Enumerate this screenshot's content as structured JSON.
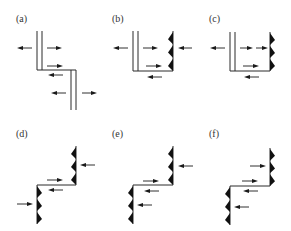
{
  "figure": {
    "panels": [
      {
        "id": "a",
        "label": "(a)",
        "label_pos": [
          16,
          22
        ],
        "upper": {
          "type": "double",
          "x": 37,
          "y1": 31,
          "y2": 70
        },
        "lower": {
          "type": "double",
          "x": 71,
          "y1": 70,
          "y2": 110
        },
        "step_y": 70,
        "arrows": [
          {
            "x1": 32,
            "x2": 17,
            "y": 48
          },
          {
            "x1": 47,
            "x2": 62,
            "y": 48
          },
          {
            "x1": 47,
            "x2": 63,
            "y": 66
          },
          {
            "x1": 63,
            "x2": 48,
            "y": 75
          },
          {
            "x1": 66,
            "x2": 51,
            "y": 93
          },
          {
            "x1": 82,
            "x2": 97,
            "y": 93
          }
        ]
      },
      {
        "id": "b",
        "label": "(b)",
        "label_pos": [
          112,
          22
        ],
        "upper": {
          "type": "double",
          "x": 133,
          "y1": 31,
          "y2": 71
        },
        "right_saw": {
          "x": 173,
          "y1": 31,
          "y2": 71,
          "dir": "left"
        },
        "step_y": 71,
        "step_x1": 133,
        "step_x2": 173,
        "arrows": [
          {
            "x1": 128,
            "x2": 113,
            "y": 48
          },
          {
            "x1": 143,
            "x2": 158,
            "y": 48
          },
          {
            "x1": 192,
            "x2": 178,
            "y": 48
          },
          {
            "x1": 146,
            "x2": 162,
            "y": 66
          },
          {
            "x1": 162,
            "x2": 147,
            "y": 77
          }
        ]
      },
      {
        "id": "c",
        "label": "(c)",
        "label_pos": [
          209,
          22
        ],
        "upper": {
          "type": "double",
          "x": 230,
          "y1": 32,
          "y2": 71
        },
        "right_saw": {
          "x": 270,
          "y1": 32,
          "y2": 71,
          "dir": "right"
        },
        "step_y": 71,
        "step_x1": 230,
        "step_x2": 270,
        "arrows": [
          {
            "x1": 225,
            "x2": 210,
            "y": 48
          },
          {
            "x1": 240,
            "x2": 253,
            "y": 48
          },
          {
            "x1": 256,
            "x2": 268,
            "y": 48
          },
          {
            "x1": 243,
            "x2": 259,
            "y": 66
          },
          {
            "x1": 259,
            "x2": 244,
            "y": 77
          }
        ]
      },
      {
        "id": "d",
        "label": "(d)",
        "label_pos": [
          16,
          137
        ],
        "upper_saw": {
          "x": 76,
          "y1": 146,
          "y2": 185,
          "dir": "left"
        },
        "lower_saw": {
          "x": 37,
          "y1": 185,
          "y2": 224,
          "dir": "right"
        },
        "step_y": 185,
        "step_x1": 37,
        "step_x2": 76,
        "arrows": [
          {
            "x1": 95,
            "x2": 80,
            "y": 165
          },
          {
            "x1": 47,
            "x2": 63,
            "y": 180
          },
          {
            "x1": 63,
            "x2": 48,
            "y": 190
          },
          {
            "x1": 17,
            "x2": 33,
            "y": 204
          }
        ]
      },
      {
        "id": "e",
        "label": "(e)",
        "label_pos": [
          112,
          137
        ],
        "upper_saw": {
          "x": 173,
          "y1": 146,
          "y2": 185,
          "dir": "left"
        },
        "lower_saw": {
          "x": 133,
          "y1": 185,
          "y2": 224,
          "dir": "left"
        },
        "step_y": 185,
        "step_x1": 133,
        "step_x2": 173,
        "arrows": [
          {
            "x1": 193,
            "x2": 178,
            "y": 166
          },
          {
            "x1": 143,
            "x2": 159,
            "y": 181
          },
          {
            "x1": 159,
            "x2": 144,
            "y": 191
          },
          {
            "x1": 152,
            "x2": 137,
            "y": 205
          }
        ]
      },
      {
        "id": "f",
        "label": "(f)",
        "label_pos": [
          209,
          137
        ],
        "upper_saw": {
          "x": 270,
          "y1": 148,
          "y2": 186,
          "dir": "right"
        },
        "lower_saw": {
          "x": 230,
          "y1": 186,
          "y2": 225,
          "dir": "left"
        },
        "step_y": 186,
        "step_x1": 230,
        "step_x2": 270,
        "arrows": [
          {
            "x1": 250,
            "x2": 266,
            "y": 166
          },
          {
            "x1": 242,
            "x2": 258,
            "y": 181
          },
          {
            "x1": 258,
            "x2": 243,
            "y": 191
          },
          {
            "x1": 249,
            "x2": 234,
            "y": 207
          }
        ]
      }
    ]
  }
}
